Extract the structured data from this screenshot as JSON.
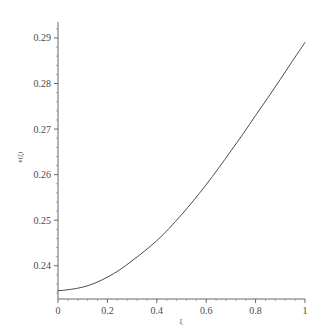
{
  "chart_data": {
    "type": "line",
    "title": "",
    "subtitle": "",
    "xlabel": "ξ",
    "ylabel": "e(ξ)",
    "xlim": [
      0,
      1
    ],
    "ylim": [
      0.2327,
      0.2935
    ],
    "grid": false,
    "legend": null,
    "x_ticks": [
      0,
      0.2,
      0.4,
      0.6,
      0.8,
      1
    ],
    "x_tick_labels": [
      "0",
      "0.2",
      "0.4",
      "0.6",
      "0.8",
      "1"
    ],
    "x_minor_tick_count": 4,
    "y_ticks": [
      0.24,
      0.25,
      0.26,
      0.27,
      0.28,
      0.29
    ],
    "y_tick_labels": [
      "0.24",
      "0.25",
      "0.26",
      "0.27",
      "0.28",
      "0.29"
    ],
    "y_minor_tick_count": 4,
    "line_color": "#4b4b4b",
    "background_color": "#ffffff",
    "axis_color": "#555555",
    "series": [
      {
        "name": "e(ξ)",
        "x": [
          0.0,
          0.05,
          0.1,
          0.15,
          0.2,
          0.25,
          0.3,
          0.35,
          0.4,
          0.45,
          0.5,
          0.55,
          0.6,
          0.65,
          0.7,
          0.75,
          0.8,
          0.85,
          0.9,
          0.95,
          1.0
        ],
        "values": [
          0.2345,
          0.2348,
          0.2353,
          0.2362,
          0.2375,
          0.2391,
          0.2411,
          0.2432,
          0.2455,
          0.2482,
          0.2512,
          0.2544,
          0.2578,
          0.2614,
          0.2652,
          0.269,
          0.273,
          0.2769,
          0.2809,
          0.285,
          0.289
        ]
      }
    ]
  },
  "axis_labels": {
    "y_axis_title": "e(ξ)",
    "x_axis_title": "ξ"
  }
}
